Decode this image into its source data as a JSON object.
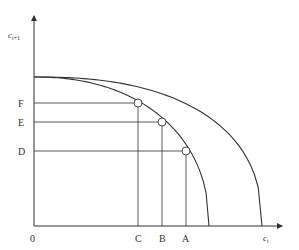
{
  "diagram": {
    "type": "production-possibility-frontier",
    "x_axis_label": {
      "base": "c",
      "sub": "t"
    },
    "y_axis_label": {
      "base": "c",
      "sub": "t+1"
    },
    "origin_label": "0",
    "curves": [
      {
        "name": "inner-frontier"
      },
      {
        "name": "outer-frontier"
      }
    ],
    "points": [
      {
        "x_label": "C",
        "y_label": "F"
      },
      {
        "x_label": "B",
        "y_label": "E"
      },
      {
        "x_label": "A",
        "y_label": "D"
      }
    ],
    "colors": {
      "line": "#333333",
      "background": "#ffffff"
    }
  }
}
